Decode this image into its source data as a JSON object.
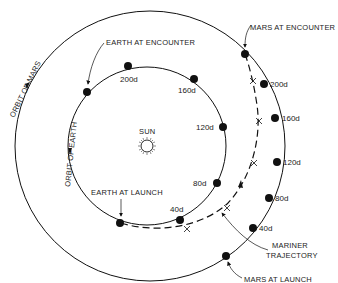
{
  "diagram": {
    "sun": {
      "label": "SUN"
    },
    "orbits": {
      "earth": {
        "label": "ORBIT OF EARTH"
      },
      "mars": {
        "label": "ORBIT OF MARS"
      }
    },
    "earth_positions": {
      "launch_label": "EARTH AT LAUNCH",
      "encounter_label": "EARTH AT ENCOUNTER",
      "days": [
        "40d",
        "80d",
        "120d",
        "160d",
        "200d"
      ]
    },
    "mars_positions": {
      "launch_label": "MARS AT LAUNCH",
      "encounter_label": "MARS AT ENCOUNTER",
      "days": [
        "40d",
        "80d",
        "120d",
        "160d",
        "200d"
      ]
    },
    "trajectory": {
      "label_line1": "MARINER",
      "label_line2": "TRAJECTORY"
    },
    "colors": {
      "ink": "#111111",
      "background": "#ffffff"
    }
  }
}
